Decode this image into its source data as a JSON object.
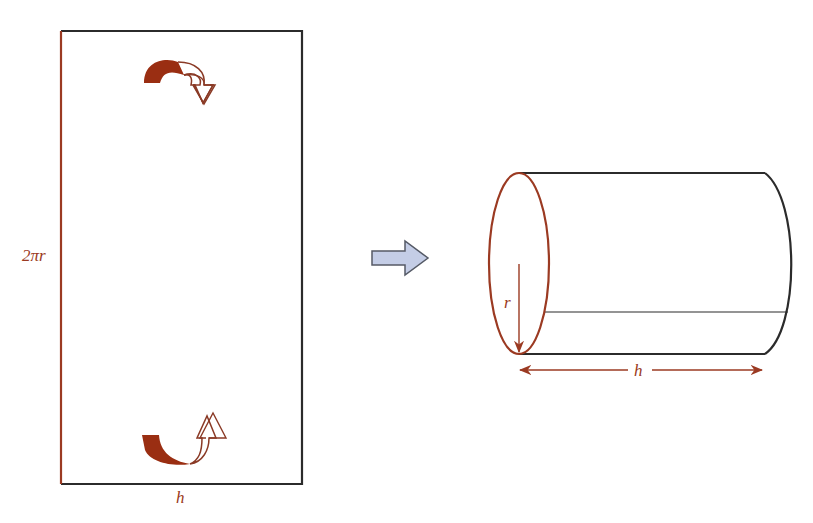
{
  "diagram": {
    "colors": {
      "accent": "#9b3a22",
      "accent_fill": "#9a2e12",
      "outline": "#2b2b2b",
      "arrow_fill": "#c4cde6",
      "arrow_stroke": "#555a66"
    },
    "rectangle": {
      "side_label": "2πr",
      "bottom_label": "h",
      "top_curl_icon": "curl-down-arrow",
      "bottom_curl_icon": "curl-up-arrow"
    },
    "transform_arrow": {
      "icon": "right-arrow"
    },
    "cylinder": {
      "radius_label": "r",
      "length_label": "h"
    }
  }
}
